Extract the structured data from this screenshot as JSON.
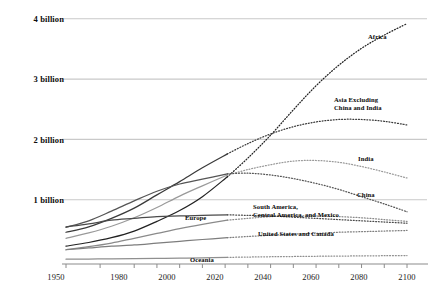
{
  "chart_data": {
    "type": "line",
    "title": "",
    "subtitle": "",
    "xlabel": "",
    "ylabel": "",
    "xlim": [
      1950,
      2100
    ],
    "ylim": [
      0,
      4400000000
    ],
    "grid": true,
    "legend_position": "inline-right-of-series",
    "projection_start_year": 2021,
    "projection_style": "dotted",
    "history_style": "solid",
    "x_ticks_major": [
      1950,
      1980,
      2000,
      2020,
      2040,
      2060,
      2080,
      2100
    ],
    "x_tick_labels": [
      "1950",
      "1980",
      "2000",
      "2020",
      "2040",
      "2060",
      "2080",
      "2100"
    ],
    "x_ticks_minor": [
      1965,
      1990,
      2010,
      2030,
      2050,
      2070,
      2090
    ],
    "y_ticks": [
      1000000000,
      2000000000,
      3000000000,
      4000000000
    ],
    "y_tick_labels": [
      "1 billion",
      "2 billion",
      "3 billion",
      "4 billion"
    ],
    "x": [
      1950,
      1960,
      1970,
      1980,
      1990,
      2000,
      2010,
      2021,
      2030,
      2040,
      2050,
      2060,
      2070,
      2080,
      2090,
      2100
    ],
    "series": [
      {
        "name": "Africa",
        "label": "Africa",
        "color": "#222222",
        "label_x": 368,
        "label_y": 33,
        "values": [
          0.23,
          0.29,
          0.37,
          0.48,
          0.64,
          0.82,
          1.05,
          1.38,
          1.69,
          2.07,
          2.49,
          2.89,
          3.23,
          3.51,
          3.73,
          3.92
        ]
      },
      {
        "name": "Asia Excluding China and India",
        "label": "Asia Excluding\nChina and India",
        "color": "#3a3a3a",
        "label_x": 334,
        "label_y": 96,
        "values": [
          0.46,
          0.55,
          0.69,
          0.86,
          1.08,
          1.3,
          1.53,
          1.76,
          1.93,
          2.09,
          2.21,
          2.29,
          2.33,
          2.33,
          2.3,
          2.24
        ]
      },
      {
        "name": "India",
        "label": "India",
        "color": "#9a9a9a",
        "label_x": 358,
        "label_y": 155,
        "values": [
          0.36,
          0.45,
          0.56,
          0.7,
          0.87,
          1.06,
          1.23,
          1.41,
          1.5,
          1.58,
          1.64,
          1.65,
          1.62,
          1.55,
          1.46,
          1.36
        ]
      },
      {
        "name": "China",
        "label": "China",
        "color": "#555555",
        "label_x": 357,
        "label_y": 191,
        "values": [
          0.54,
          0.65,
          0.81,
          0.98,
          1.14,
          1.26,
          1.34,
          1.43,
          1.44,
          1.41,
          1.35,
          1.27,
          1.17,
          1.05,
          0.93,
          0.8
        ]
      },
      {
        "name": "South America, Central America, and Mexico",
        "label": "South America,\nCentral America, and Mexico",
        "color": "#8a8a8a",
        "label_x": 253,
        "label_y": 203,
        "values": [
          0.17,
          0.22,
          0.28,
          0.36,
          0.44,
          0.52,
          0.59,
          0.66,
          0.69,
          0.72,
          0.73,
          0.73,
          0.72,
          0.7,
          0.67,
          0.64
        ]
      },
      {
        "name": "Europe",
        "label": "Europe",
        "color": "#4a4a4a",
        "label_x": 185,
        "label_y": 214,
        "values": [
          0.55,
          0.6,
          0.66,
          0.69,
          0.72,
          0.73,
          0.74,
          0.75,
          0.74,
          0.73,
          0.71,
          0.69,
          0.67,
          0.65,
          0.63,
          0.61
        ]
      },
      {
        "name": "United States and Canada",
        "label": "United States and Canada",
        "color": "#7d7d7d",
        "label_x": 258,
        "label_y": 230,
        "values": [
          0.17,
          0.2,
          0.23,
          0.25,
          0.28,
          0.31,
          0.34,
          0.37,
          0.39,
          0.41,
          0.43,
          0.44,
          0.46,
          0.47,
          0.48,
          0.49
        ]
      },
      {
        "name": "Oceania",
        "label": "Oceania",
        "color": "#8f8f8f",
        "label_x": 190,
        "label_y": 256,
        "values": [
          0.013,
          0.016,
          0.02,
          0.023,
          0.027,
          0.031,
          0.037,
          0.044,
          0.049,
          0.054,
          0.058,
          0.062,
          0.065,
          0.068,
          0.071,
          0.073
        ]
      }
    ]
  },
  "axis": {
    "y_labels": [
      "4 billion",
      "3 billion",
      "2 billion",
      "1 billion"
    ],
    "x_labels": [
      "1950",
      "1980",
      "2000",
      "2020",
      "2040",
      "2060",
      "2080",
      "2100"
    ]
  },
  "colors": {
    "gridline": "#c9c9c9",
    "axis": "#8c8c8c",
    "text": "#111111",
    "background": "#ffffff"
  }
}
